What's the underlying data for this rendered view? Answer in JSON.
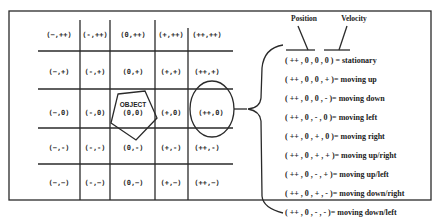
{
  "grid": {
    "rows": [
      [
        "(−,++)",
        "(-,++)",
        "(0,++)",
        "(+,++)",
        "(++,++)"
      ],
      [
        "(−,+)",
        "(-,+)",
        "(0,+)",
        "(+,+)",
        "(++,+)"
      ],
      [
        "(−,0)",
        "(-,0)",
        "(0,0)",
        "(+,0)",
        "(++,0)"
      ],
      [
        "(−,-)",
        "(-,-)",
        "(0,-)",
        "(+,-)",
        "(++,-)"
      ],
      [
        "(−,−)",
        "(-,−)",
        "(0,−)",
        "(+,−)",
        "(++,−)"
      ]
    ],
    "object_label": "OBJECT",
    "highlighted_cell": "(++,0)"
  },
  "legend": {
    "position_label": "Position",
    "velocity_label": "Velocity",
    "states": [
      "( ++ , 0 , 0 , 0 ) = stationary",
      "( ++ , 0 , 0 , + )= moving up",
      "( ++ , 0 , 0 , - )= moving down",
      "( ++ , 0 , - , 0 )= moving left",
      "( ++ , 0 , + , 0 )= moving right",
      "( ++ , 0 , + , + )= moving up/right",
      "( ++ , 0 , - , + )= moving up/left",
      "( ++ , 0 , + , - )= moving down/right",
      "( ++ , 0 , - , - )= moving down/left"
    ]
  }
}
